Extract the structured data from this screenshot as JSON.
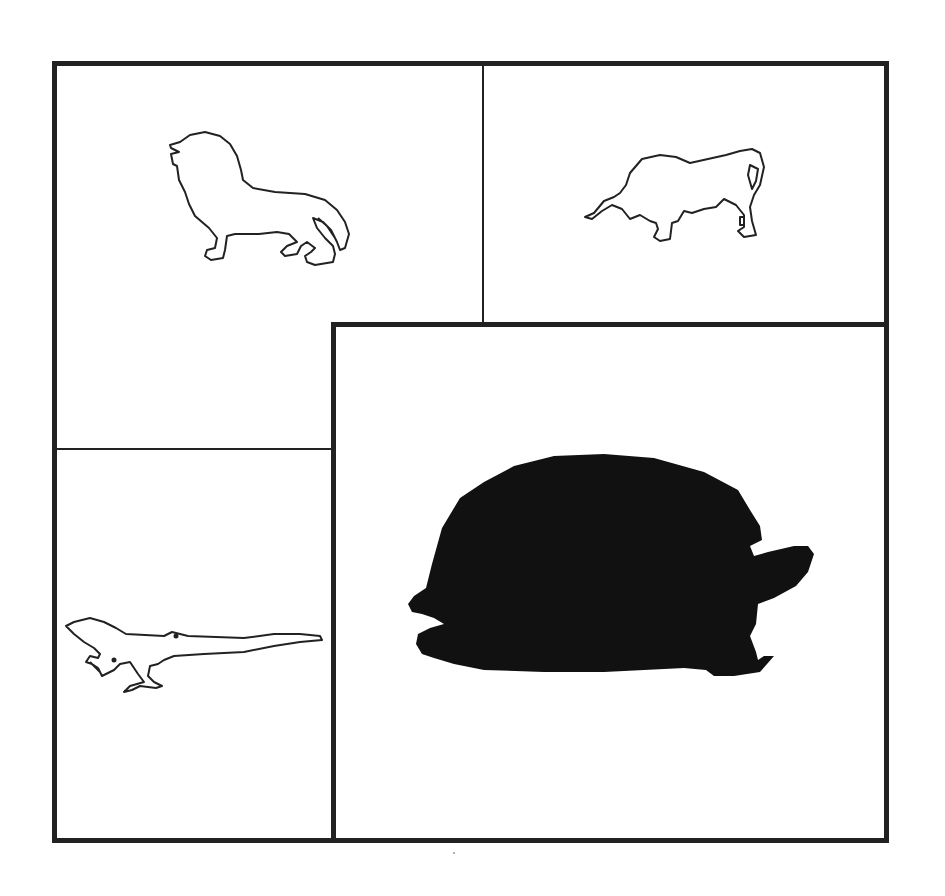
{
  "figure": {
    "panels": [
      {
        "id": "top-left",
        "animal": "lion",
        "style": "outline"
      },
      {
        "id": "top-right",
        "animal": "bull",
        "style": "outline"
      },
      {
        "id": "bottom-left",
        "animal": "lizard",
        "style": "outline"
      },
      {
        "id": "bottom-right",
        "animal": "tortoise",
        "style": "filled",
        "emphasized": true
      }
    ],
    "colors": {
      "border": "#222222",
      "outline": "#222222",
      "fill": "#111111",
      "background": "#ffffff"
    }
  }
}
